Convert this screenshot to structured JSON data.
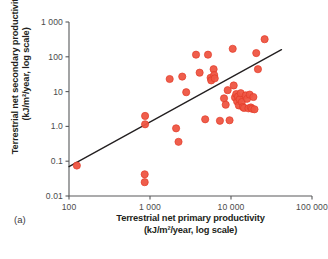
{
  "figure": {
    "panel_letter": "(a)",
    "dot_color": "#ee5542",
    "dot_edge_color": "#e23b28",
    "line_color": "#231f20",
    "axis_color": "#58595b",
    "tick_text_color": "#4b4b4b",
    "background": "#ffffff"
  },
  "axis_titles": {
    "y_line1": "Terrestrial net secondary productivity",
    "y_line2": "(kJ/m²/year, log scale)",
    "x_line1": "Terrestrial net primary productivity",
    "x_line2": "(kJ/m²/year, log scale)"
  },
  "chart_data": {
    "type": "scatter",
    "title": "",
    "xlabel": "Terrestrial net primary productivity (kJ/m²/year, log scale)",
    "ylabel": "Terrestrial net secondary productivity (kJ/m²/year, log scale)",
    "xscale": "log",
    "yscale": "log",
    "xlim": [
      100,
      100000
    ],
    "ylim": [
      0.01,
      1000
    ],
    "grid": false,
    "legend": null,
    "xticks": [
      100,
      1000,
      10000,
      100000
    ],
    "xticklabels": [
      "100",
      "1 000",
      "10 000",
      "100 000"
    ],
    "yticks": [
      0.01,
      0.1,
      1,
      10,
      100,
      1000
    ],
    "yticklabels": [
      "0.01",
      "0.1",
      "1.0",
      "10",
      "100",
      "1 000"
    ],
    "series": [
      {
        "name": "observations",
        "marker": "circle",
        "color": "#ee5542",
        "points": [
          [
            125,
            0.075
          ],
          [
            870,
            2.0
          ],
          [
            870,
            1.15
          ],
          [
            860,
            0.042
          ],
          [
            860,
            0.025
          ],
          [
            1750,
            23
          ],
          [
            2100,
            0.88
          ],
          [
            2250,
            0.36
          ],
          [
            2500,
            27
          ],
          [
            2800,
            9.6
          ],
          [
            3700,
            115
          ],
          [
            4100,
            35
          ],
          [
            4800,
            1.6
          ],
          [
            5200,
            115
          ],
          [
            5600,
            25
          ],
          [
            5700,
            21
          ],
          [
            6100,
            44
          ],
          [
            6200,
            30
          ],
          [
            6300,
            24
          ],
          [
            7300,
            1.45
          ],
          [
            8200,
            6.4
          ],
          [
            8600,
            4.2
          ],
          [
            9100,
            11
          ],
          [
            9600,
            1.5
          ],
          [
            10500,
            170
          ],
          [
            10800,
            15
          ],
          [
            11200,
            6.8
          ],
          [
            11600,
            8.5
          ],
          [
            11900,
            5.2
          ],
          [
            12200,
            7.2
          ],
          [
            12500,
            4.0
          ],
          [
            12800,
            6.0
          ],
          [
            13200,
            9.0
          ],
          [
            13600,
            5.0
          ],
          [
            14000,
            3.6
          ],
          [
            14500,
            3.4
          ],
          [
            15200,
            7.8
          ],
          [
            15800,
            6.2
          ],
          [
            16400,
            3.3
          ],
          [
            17000,
            8.2
          ],
          [
            17600,
            3.5
          ],
          [
            18200,
            3.2
          ],
          [
            18900,
            7.0
          ],
          [
            19500,
            3.1
          ],
          [
            20500,
            128
          ],
          [
            21500,
            44
          ],
          [
            26000,
            320
          ]
        ]
      }
    ],
    "trend_line": {
      "type": "log-log-linear",
      "x_start": 100,
      "y_start": 0.07,
      "x_end": 42000,
      "y_end": 160
    }
  }
}
